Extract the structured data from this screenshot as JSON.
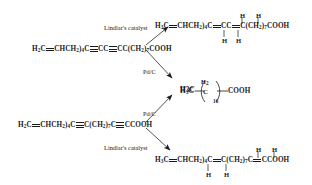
{
  "diagram": {
    "type": "reaction-scheme",
    "ink_color": "#1a1a1a",
    "background": "#ffffff"
  },
  "reactants": {
    "top": {
      "name": "top-left-reactant",
      "segments": [
        {
          "text": "H",
          "sub": "2"
        },
        {
          "text": "C"
        },
        {
          "bond": "double"
        },
        {
          "text": "CHCH"
        },
        {
          "sub": "2"
        },
        {
          "text": ")"
        },
        {
          "text": "C"
        },
        {
          "bond": "triple"
        },
        {
          "text": "CC"
        },
        {
          "bond": "triple"
        },
        {
          "text": "CC"
        },
        {
          "text": "CH"
        },
        {
          "sub": "2"
        },
        {
          "text": "COOH"
        }
      ],
      "parts": [
        "H3C",
        "CHCH2)4C",
        "CC",
        "C(CH2)7COOH"
      ],
      "plain": "H2C=CHCH2)4C≡CC≡CC(CH2)7COOH"
    },
    "bottom": {
      "name": "bottom-left-reactant",
      "parts": [
        "H3C",
        "CHCH2)4C",
        "C(CH2)7C",
        "CCOOH"
      ],
      "plain": "H2C=CHCH2)4C≡C(CH2)7C≡CCOOH"
    }
  },
  "products": {
    "top_right": {
      "name": "top-right-product",
      "parts": [
        "H3C",
        "CHCH2)4C",
        "CC",
        "C(CH2)7COOH"
      ],
      "h_labels_above": [
        "H",
        "H"
      ],
      "h_labels_below": [
        "H",
        "H"
      ],
      "plain": "H3C=CHCH2)4C=CC=C(CH2)7COOH"
    },
    "center": {
      "name": "center-product-stearic-acid",
      "left": "H3C",
      "repeat_unit_top": "H2",
      "repeat_unit_center": "C",
      "repeat_count": "16",
      "right": "COOH",
      "plain": "H3C(CH2)16COOH"
    },
    "bottom_right": {
      "name": "bottom-right-product",
      "parts": [
        "H3C",
        "CHCH2)4C",
        "C(CH2)7C",
        "CCOOH"
      ],
      "h_labels_above": [
        "H",
        "H"
      ],
      "h_labels_below": [
        "H",
        "H"
      ],
      "plain": "H3C=CHCH2)4C=C(CH2)7C=CCOOH"
    }
  },
  "conditions": {
    "top_arrow": {
      "name": "lindlar-catalyst-top",
      "label": "Lindlar's catalyst",
      "reagent": "H2"
    },
    "upper_middle_arrow": {
      "name": "pd-c-upper",
      "label": "Pd/C"
    },
    "lower_middle_arrow": {
      "name": "pd-c-lower",
      "label": "Pd/C"
    },
    "bottom_arrow": {
      "name": "lindlar-catalyst-bottom",
      "label": "Lindlar's catalyst"
    }
  },
  "atom_labels": {
    "h": "H",
    "h2": "H",
    "h2_sub": "2"
  }
}
